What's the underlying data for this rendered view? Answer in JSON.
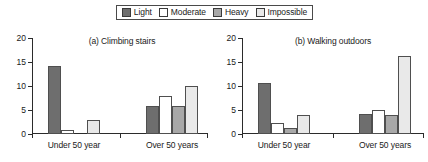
{
  "legend": {
    "position": "top-center",
    "entries": [
      {
        "label": "Light",
        "color": "#6e6e6e"
      },
      {
        "label": "Moderate",
        "color": "#ffffff"
      },
      {
        "label": "Heavy",
        "color": "#a8a8a8"
      },
      {
        "label": "Impossible",
        "color": "#e9e9e9"
      }
    ]
  },
  "chart_data": [
    {
      "type": "bar",
      "title": "(a) Climbing stairs",
      "xlabel": "",
      "ylabel": "",
      "categories": [
        "Under 50 year",
        "Over 50 years"
      ],
      "ylim": [
        0,
        20
      ],
      "yticks": [
        0,
        5,
        10,
        15,
        20
      ],
      "grid": false,
      "legend_position": "top-center",
      "series": [
        {
          "name": "Light",
          "color": "#6e6e6e",
          "values": [
            14.2,
            5.9
          ]
        },
        {
          "name": "Moderate",
          "color": "#ffffff",
          "values": [
            0.9,
            8.0
          ]
        },
        {
          "name": "Heavy",
          "color": "#a8a8a8",
          "values": [
            0,
            5.8
          ]
        },
        {
          "name": "Impossible",
          "color": "#e9e9e9",
          "values": [
            2.9,
            9.9
          ]
        }
      ]
    },
    {
      "type": "bar",
      "title": "(b) Walking outdoors",
      "xlabel": "",
      "ylabel": "",
      "categories": [
        "Under 50 year",
        "Over 50 years"
      ],
      "ylim": [
        0,
        20
      ],
      "yticks": [
        0,
        5,
        10,
        15,
        20
      ],
      "grid": false,
      "legend_position": "top-center",
      "series": [
        {
          "name": "Light",
          "color": "#6e6e6e",
          "values": [
            10.7,
            4.1
          ]
        },
        {
          "name": "Moderate",
          "color": "#ffffff",
          "values": [
            2.2,
            5.0
          ]
        },
        {
          "name": "Heavy",
          "color": "#a8a8a8",
          "values": [
            1.2,
            3.9
          ]
        },
        {
          "name": "Impossible",
          "color": "#e9e9e9",
          "values": [
            4.0,
            16.2
          ]
        }
      ]
    }
  ]
}
